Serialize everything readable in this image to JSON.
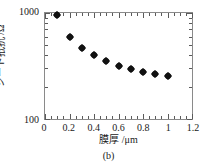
{
  "chart_data": {
    "type": "scatter",
    "title": "",
    "caption": "(b)",
    "xlabel": "膜厚 /μm",
    "ylabel": "シート抵抗 /Ω",
    "xlim": [
      0,
      1.2
    ],
    "ylim": [
      100,
      1000
    ],
    "yscale": "log",
    "xscale": "linear",
    "grid": false,
    "legend": null,
    "xticks": [
      "0",
      "0.2",
      "0.4",
      "0.6",
      "0.8",
      "1",
      "1.2"
    ],
    "xtick_values": [
      0,
      0.2,
      0.4,
      0.6,
      0.8,
      1.0,
      1.2
    ],
    "yticks": [
      "100",
      "1000"
    ],
    "ytick_values": [
      100,
      1000
    ],
    "marker": "filled-diamond",
    "marker_color": "#111111",
    "x": [
      0.1,
      0.2,
      0.3,
      0.4,
      0.5,
      0.6,
      0.7,
      0.8,
      0.9,
      1.0
    ],
    "values": [
      955,
      600,
      470,
      405,
      350,
      318,
      295,
      280,
      266,
      256
    ],
    "series": [
      {
        "name": "シート抵抗",
        "x": [
          0.1,
          0.2,
          0.3,
          0.4,
          0.5,
          0.6,
          0.7,
          0.8,
          0.9,
          1.0
        ],
        "values": [
          955,
          600,
          470,
          405,
          350,
          318,
          295,
          280,
          266,
          256
        ]
      }
    ]
  },
  "axis_colors": {
    "frame": "#8a8a8a",
    "tick": "#5a5a5a",
    "text": "#1a1a1a",
    "background": "#ffffff"
  }
}
